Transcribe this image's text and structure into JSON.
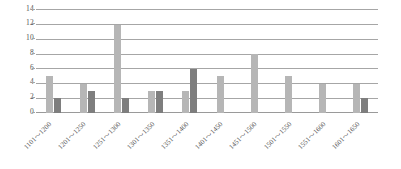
{
  "chart_data": {
    "type": "bar",
    "title": "",
    "subtitle": "",
    "xlabel": "",
    "ylabel": "",
    "ylim": [
      0,
      14
    ],
    "yticks": [
      0,
      2,
      4,
      6,
      8,
      10,
      12,
      14
    ],
    "grid": true,
    "legend": "none",
    "orientation": "vertical",
    "grouping": "grouped",
    "categories": [
      "1101～1200",
      "1201～1250",
      "1251～1300",
      "1301～1350",
      "1351～1400",
      "1401～1450",
      "1451～1500",
      "1501～1550",
      "1551～1600",
      "1601～1650"
    ],
    "series": [
      {
        "name": "series-1",
        "color": "#b6b6b6",
        "values": [
          5,
          4,
          12,
          3,
          3,
          5,
          8,
          5,
          4,
          4
        ]
      },
      {
        "name": "series-2",
        "color": "#7e7e7e",
        "values": [
          2,
          3,
          2,
          3,
          6,
          0,
          0,
          0,
          0,
          2
        ]
      }
    ]
  },
  "axis": {
    "y_tick_labels": [
      "0",
      "2",
      "4",
      "6",
      "8",
      "10",
      "12",
      "14"
    ],
    "x_tick_labels": [
      "1101～1200",
      "1201～1250",
      "1251～1300",
      "1301～1350",
      "1351～1400",
      "1401～1450",
      "1451～1500",
      "1501～1550",
      "1551～1600",
      "1601～1650"
    ]
  },
  "colors": {
    "series_1": "#b6b6b6",
    "series_2": "#7e7e7e",
    "gridline": "#a6a6a6",
    "tick_text": "#555555",
    "background": "#ffffff"
  }
}
